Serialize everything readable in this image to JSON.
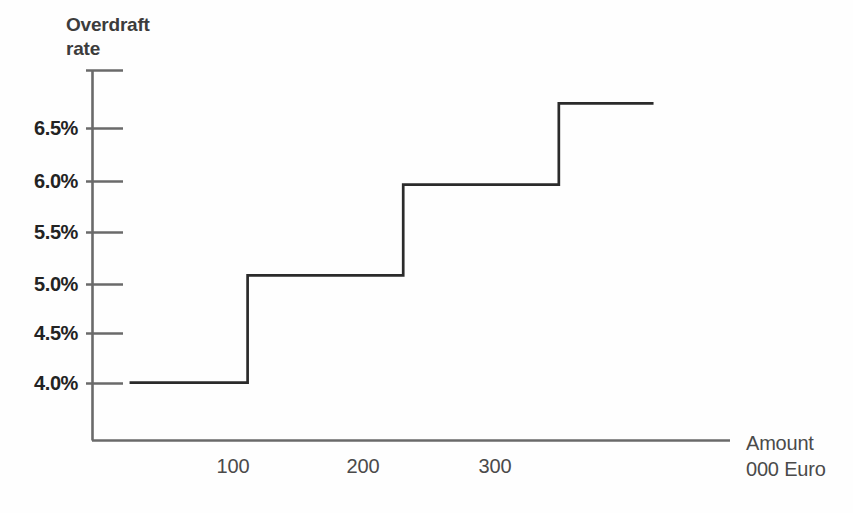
{
  "chart_data": {
    "type": "line",
    "subtype": "step",
    "title": "",
    "ylabel": "Overdraft\nrate",
    "xlabel": "Amount\n000 Euro",
    "ytick_labels": [
      "6.5%",
      "6.0%",
      "5.5%",
      "5.0%",
      "4.5%",
      "4.0%"
    ],
    "ytick_values": [
      6.5,
      6.0,
      5.5,
      5.0,
      4.5,
      4.0
    ],
    "xtick_labels": [
      "100",
      "200",
      "300"
    ],
    "xtick_values": [
      100,
      200,
      300
    ],
    "ylim": [
      3.45,
      7.0
    ],
    "xlim": [
      0,
      410
    ],
    "grid": false,
    "legend": false,
    "line_color": "#2b2b2b",
    "axis_color": "#6a6a6a",
    "steps": [
      {
        "x_start": 25,
        "x_end": 100,
        "rate": 4.0,
        "label": "4.0%"
      },
      {
        "x_start": 100,
        "x_end": 200,
        "rate": 5.03,
        "label": "5.0%"
      },
      {
        "x_start": 200,
        "x_end": 300,
        "rate": 5.9,
        "label": "5.9%"
      },
      {
        "x_start": 300,
        "x_end": 360,
        "rate": 6.68,
        "label": "6.7%"
      }
    ]
  }
}
